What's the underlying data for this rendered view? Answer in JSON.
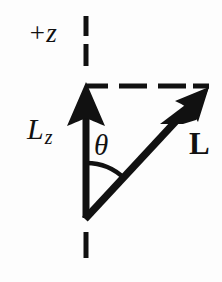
{
  "figure": {
    "background_color": "#fdfdfd",
    "ink_color": "#111111",
    "width": 222,
    "height": 282
  },
  "labels": {
    "axis_positive_z": "+z",
    "component_l": "L",
    "component_subscript": "z",
    "angle": "θ",
    "vector_l": "L"
  },
  "geometry": {
    "origin": {
      "x": 86,
      "y": 218
    },
    "lz_tip": {
      "x": 86,
      "y": 84
    },
    "l_tip": {
      "x": 208,
      "y": 88
    },
    "arc_radius": 55,
    "angle_degrees": 45,
    "axis_line_style": "dashed",
    "projection_line_style": "dashed",
    "vector_line_style": "solid"
  },
  "elements": {
    "z_axis_dashes_above": [
      {
        "y1": 16,
        "y2": 36
      },
      {
        "y1": 44,
        "y2": 66
      }
    ],
    "z_axis_dashes_below": [
      {
        "y1": 232,
        "y2": 258
      }
    ],
    "horizontal_dashes": [
      {
        "x1": 86,
        "x2": 108
      },
      {
        "x1": 119,
        "x2": 147
      },
      {
        "x1": 158,
        "x2": 186
      },
      {
        "x1": 193,
        "x2": 209
      }
    ]
  }
}
